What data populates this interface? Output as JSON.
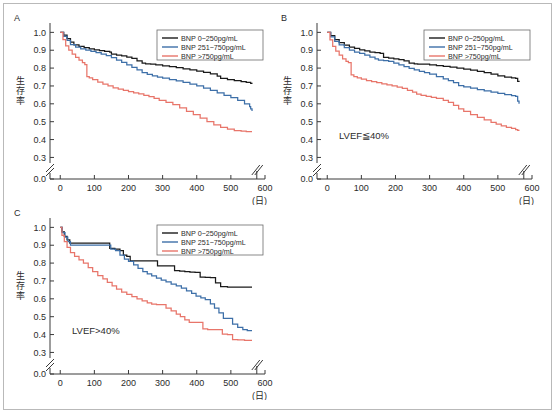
{
  "figure": {
    "panels": [
      {
        "letter": "A",
        "annotation": "",
        "chart_data": {
          "type": "line",
          "title": "A",
          "xlabel": "(日)",
          "ylabel": "生存率",
          "xlim": [
            -30,
            600
          ],
          "ylim": [
            0.28,
            1.03
          ],
          "xticks": [
            0,
            100,
            200,
            300,
            400,
            500,
            600
          ],
          "yticks": [
            0.0,
            0.3,
            0.4,
            0.5,
            0.6,
            0.7,
            0.8,
            0.9,
            1.0
          ],
          "axis_break_y": true,
          "axis_break_x": true,
          "grid": false,
          "legend_position": "top-right",
          "series": [
            {
              "name": "BNP 0~250pg/mL",
              "color": "#1a1a1a",
              "x": [
                0,
                10,
                20,
                30,
                40,
                55,
                70,
                85,
                100,
                115,
                130,
                145,
                150,
                165,
                180,
                195,
                210,
                225,
                240,
                250,
                265,
                280,
                300,
                320,
                340,
                360,
                380,
                400,
                420,
                440,
                460,
                470,
                490,
                510,
                530,
                545,
                558,
                562
              ],
              "y": [
                1.0,
                0.985,
                0.965,
                0.945,
                0.93,
                0.922,
                0.915,
                0.908,
                0.902,
                0.898,
                0.893,
                0.89,
                0.878,
                0.872,
                0.868,
                0.862,
                0.855,
                0.84,
                0.828,
                0.824,
                0.822,
                0.818,
                0.812,
                0.808,
                0.802,
                0.796,
                0.79,
                0.783,
                0.776,
                0.768,
                0.755,
                0.742,
                0.736,
                0.73,
                0.724,
                0.72,
                0.715,
                0.712
              ]
            },
            {
              "name": "BNP 251~750pg/mL",
              "color": "#3d6fa8",
              "x": [
                0,
                10,
                20,
                30,
                45,
                60,
                75,
                90,
                105,
                120,
                135,
                150,
                165,
                180,
                195,
                210,
                225,
                240,
                255,
                270,
                285,
                300,
                320,
                340,
                360,
                380,
                400,
                420,
                440,
                460,
                480,
                500,
                520,
                540,
                555,
                558,
                562
              ],
              "y": [
                1.0,
                0.978,
                0.955,
                0.932,
                0.918,
                0.908,
                0.9,
                0.893,
                0.886,
                0.878,
                0.87,
                0.858,
                0.845,
                0.832,
                0.818,
                0.804,
                0.79,
                0.775,
                0.765,
                0.757,
                0.75,
                0.744,
                0.736,
                0.728,
                0.72,
                0.71,
                0.7,
                0.688,
                0.675,
                0.662,
                0.648,
                0.635,
                0.62,
                0.6,
                0.585,
                0.572,
                0.56
              ]
            },
            {
              "name": "BNP >750pg/mL",
              "color": "#e8756a",
              "x": [
                0,
                8,
                16,
                25,
                35,
                45,
                55,
                65,
                72,
                78,
                85,
                95,
                110,
                125,
                140,
                155,
                170,
                185,
                200,
                215,
                230,
                245,
                260,
                275,
                290,
                310,
                330,
                350,
                370,
                390,
                410,
                430,
                450,
                470,
                490,
                510,
                530,
                545,
                558,
                562
              ],
              "y": [
                1.0,
                0.96,
                0.925,
                0.9,
                0.878,
                0.86,
                0.845,
                0.83,
                0.82,
                0.752,
                0.745,
                0.735,
                0.722,
                0.71,
                0.7,
                0.69,
                0.682,
                0.675,
                0.668,
                0.662,
                0.656,
                0.648,
                0.64,
                0.63,
                0.62,
                0.608,
                0.595,
                0.578,
                0.558,
                0.54,
                0.52,
                0.5,
                0.482,
                0.468,
                0.458,
                0.45,
                0.447,
                0.445,
                0.444,
                0.444
              ]
            }
          ]
        }
      },
      {
        "letter": "B",
        "annotation": "LVEF≦40%",
        "chart_data": {
          "type": "line",
          "title": "B",
          "xlabel": "(日)",
          "ylabel": "生存率",
          "xlim": [
            -30,
            600
          ],
          "ylim": [
            0.28,
            1.03
          ],
          "xticks": [
            0,
            100,
            200,
            300,
            400,
            500,
            600
          ],
          "yticks": [
            0.0,
            0.3,
            0.4,
            0.5,
            0.6,
            0.7,
            0.8,
            0.9,
            1.0
          ],
          "axis_break_y": true,
          "axis_break_x": true,
          "grid": false,
          "legend_position": "top-right",
          "series": [
            {
              "name": "BNP 0~250pg/mL",
              "color": "#1a1a1a",
              "x": [
                0,
                10,
                22,
                35,
                50,
                65,
                80,
                95,
                110,
                125,
                140,
                155,
                165,
                180,
                195,
                210,
                225,
                240,
                255,
                265,
                280,
                300,
                320,
                340,
                360,
                380,
                400,
                420,
                440,
                460,
                480,
                500,
                520,
                540,
                552,
                558,
                562
              ],
              "y": [
                1.0,
                0.982,
                0.96,
                0.942,
                0.928,
                0.918,
                0.91,
                0.902,
                0.896,
                0.89,
                0.886,
                0.882,
                0.86,
                0.856,
                0.852,
                0.848,
                0.84,
                0.828,
                0.824,
                0.822,
                0.822,
                0.818,
                0.814,
                0.81,
                0.806,
                0.8,
                0.794,
                0.788,
                0.782,
                0.775,
                0.766,
                0.756,
                0.75,
                0.745,
                0.742,
                0.726,
                0.722
              ]
            },
            {
              "name": "BNP 251~750pg/mL",
              "color": "#3d6fa8",
              "x": [
                0,
                10,
                22,
                35,
                50,
                65,
                80,
                95,
                110,
                125,
                140,
                150,
                165,
                180,
                195,
                210,
                225,
                240,
                255,
                270,
                285,
                300,
                320,
                340,
                355,
                370,
                385,
                400,
                420,
                440,
                460,
                480,
                500,
                520,
                540,
                552,
                558,
                562
              ],
              "y": [
                1.0,
                0.975,
                0.95,
                0.93,
                0.915,
                0.9,
                0.89,
                0.882,
                0.872,
                0.862,
                0.852,
                0.845,
                0.842,
                0.838,
                0.828,
                0.818,
                0.808,
                0.798,
                0.79,
                0.782,
                0.774,
                0.766,
                0.752,
                0.74,
                0.73,
                0.718,
                0.702,
                0.695,
                0.688,
                0.68,
                0.672,
                0.665,
                0.658,
                0.652,
                0.646,
                0.642,
                0.615,
                0.6
              ]
            },
            {
              "name": "BNP >750pg/mL",
              "color": "#e8756a",
              "x": [
                0,
                8,
                16,
                25,
                35,
                45,
                55,
                62,
                70,
                78,
                88,
                100,
                115,
                130,
                145,
                160,
                175,
                190,
                205,
                220,
                235,
                250,
                262,
                275,
                290,
                305,
                320,
                340,
                355,
                370,
                385,
                400,
                420,
                440,
                460,
                480,
                495,
                510,
                525,
                540,
                552,
                558,
                562
              ],
              "y": [
                1.0,
                0.958,
                0.922,
                0.895,
                0.872,
                0.852,
                0.838,
                0.83,
                0.762,
                0.752,
                0.745,
                0.738,
                0.73,
                0.724,
                0.718,
                0.712,
                0.706,
                0.7,
                0.694,
                0.686,
                0.676,
                0.666,
                0.655,
                0.648,
                0.642,
                0.636,
                0.63,
                0.62,
                0.608,
                0.592,
                0.572,
                0.558,
                0.54,
                0.524,
                0.51,
                0.496,
                0.486,
                0.476,
                0.468,
                0.462,
                0.456,
                0.452,
                0.45
              ]
            }
          ]
        }
      },
      {
        "letter": "C",
        "annotation": "LVEF>40%",
        "chart_data": {
          "type": "line",
          "title": "C",
          "xlabel": "(日)",
          "ylabel": "生存率",
          "xlim": [
            -30,
            600
          ],
          "ylim": [
            0.28,
            1.03
          ],
          "xticks": [
            0,
            100,
            200,
            300,
            400,
            500,
            600
          ],
          "yticks": [
            0.0,
            0.3,
            0.4,
            0.5,
            0.6,
            0.7,
            0.8,
            0.9,
            1.0
          ],
          "axis_break_y": true,
          "axis_break_x": true,
          "grid": false,
          "legend_position": "top-right",
          "series": [
            {
              "name": "BNP 0~250pg/mL",
              "color": "#1a1a1a",
              "x": [
                0,
                5,
                12,
                20,
                28,
                36,
                45,
                60,
                80,
                100,
                120,
                140,
                145,
                160,
                175,
                185,
                195,
                205,
                220,
                240,
                260,
                272,
                285,
                300,
                320,
                335,
                350,
                365,
                380,
                395,
                410,
                425,
                440,
                455,
                470,
                490,
                510,
                530,
                562
              ],
              "y": [
                1.0,
                0.975,
                0.95,
                0.93,
                0.912,
                0.912,
                0.912,
                0.912,
                0.912,
                0.912,
                0.912,
                0.912,
                0.882,
                0.878,
                0.87,
                0.845,
                0.838,
                0.812,
                0.812,
                0.812,
                0.812,
                0.812,
                0.785,
                0.785,
                0.785,
                0.758,
                0.755,
                0.752,
                0.75,
                0.748,
                0.722,
                0.72,
                0.718,
                0.69,
                0.668,
                0.666,
                0.666,
                0.666,
                0.666
              ]
            },
            {
              "name": "BNP 251~750pg/mL",
              "color": "#3d6fa8",
              "x": [
                0,
                6,
                14,
                22,
                30,
                38,
                48,
                60,
                80,
                100,
                120,
                140,
                148,
                162,
                175,
                188,
                200,
                215,
                228,
                242,
                255,
                268,
                282,
                296,
                310,
                325,
                340,
                355,
                370,
                385,
                398,
                412,
                425,
                440,
                452,
                465,
                478,
                492,
                505,
                520,
                535,
                548,
                558,
                562
              ],
              "y": [
                1.0,
                0.97,
                0.945,
                0.92,
                0.9,
                0.9,
                0.9,
                0.9,
                0.9,
                0.9,
                0.9,
                0.9,
                0.878,
                0.87,
                0.845,
                0.822,
                0.81,
                0.79,
                0.77,
                0.752,
                0.74,
                0.728,
                0.716,
                0.705,
                0.695,
                0.682,
                0.672,
                0.66,
                0.645,
                0.63,
                0.615,
                0.605,
                0.595,
                0.572,
                0.548,
                0.522,
                0.49,
                0.49,
                0.458,
                0.44,
                0.428,
                0.422,
                0.422,
                0.422
              ]
            },
            {
              "name": "BNP >750pg/mL",
              "color": "#e8756a",
              "x": [
                0,
                5,
                12,
                20,
                30,
                42,
                55,
                68,
                82,
                95,
                110,
                125,
                138,
                152,
                165,
                180,
                195,
                210,
                225,
                240,
                255,
                268,
                282,
                296,
                310,
                325,
                340,
                352,
                365,
                378,
                392,
                405,
                418,
                432,
                445,
                460,
                475,
                490,
                505,
                520,
                540,
                558,
                562
              ],
              "y": [
                1.0,
                0.955,
                0.92,
                0.888,
                0.858,
                0.838,
                0.818,
                0.8,
                0.775,
                0.752,
                0.73,
                0.712,
                0.692,
                0.672,
                0.655,
                0.638,
                0.625,
                0.612,
                0.6,
                0.588,
                0.578,
                0.57,
                0.568,
                0.568,
                0.548,
                0.532,
                0.515,
                0.5,
                0.482,
                0.468,
                0.468,
                0.468,
                0.432,
                0.428,
                0.428,
                0.428,
                0.402,
                0.4,
                0.372,
                0.37,
                0.368,
                0.368,
                0.368
              ]
            }
          ]
        }
      }
    ]
  }
}
